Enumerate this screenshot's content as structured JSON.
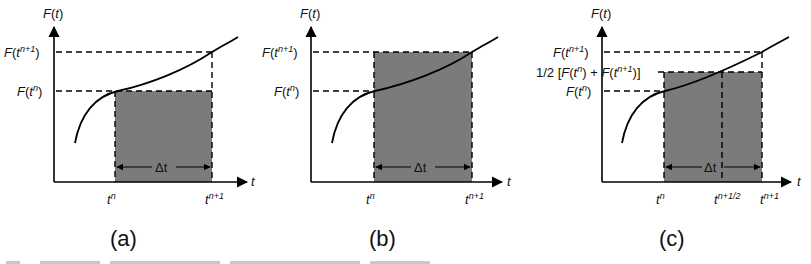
{
  "figure": {
    "panels": [
      {
        "id": "a",
        "caption": "(a)",
        "y_axis_label": "F(t)",
        "x_axis_label": "t",
        "y_levels": [
          {
            "label_base": "F(t",
            "label_sup": "n+1",
            "label_close": ")"
          },
          {
            "label_base": "F(t",
            "label_sup": "n",
            "label_close": ")"
          }
        ],
        "x_ticks": [
          {
            "base": "t",
            "sup": "n"
          },
          {
            "base": "t",
            "sup": "n+1"
          }
        ],
        "interval_label": "Δt",
        "shaded_height": "F(t^n)"
      },
      {
        "id": "b",
        "caption": "(b)",
        "y_axis_label": "F(t)",
        "x_axis_label": "t",
        "y_levels": [
          {
            "label_base": "F(t",
            "label_sup": "n+1",
            "label_close": ")"
          },
          {
            "label_base": "F(t",
            "label_sup": "n",
            "label_close": ")"
          }
        ],
        "x_ticks": [
          {
            "base": "t",
            "sup": "n"
          },
          {
            "base": "t",
            "sup": "n+1"
          }
        ],
        "interval_label": "Δt",
        "shaded_height": "F(t^(n+1))"
      },
      {
        "id": "c",
        "caption": "(c)",
        "y_axis_label": "F(t)",
        "x_axis_label": "t",
        "y_levels": [
          {
            "label_base": "F(t",
            "label_sup": "n+1",
            "label_close": ")"
          },
          {
            "label_mid_prefix": "1/2 [F(t",
            "label_mid_sup1": "n",
            "label_mid_middle": ") + F(t",
            "label_mid_sup2": "n+1",
            "label_mid_close": ")]"
          },
          {
            "label_base": "F(t",
            "label_sup": "n",
            "label_close": ")"
          }
        ],
        "x_ticks": [
          {
            "base": "t",
            "sup": "n"
          },
          {
            "base": "t",
            "sup": "n+1/2"
          },
          {
            "base": "t",
            "sup": "n+1"
          }
        ],
        "interval_label": "Δt",
        "shaded_height": "1/2 [F(t^n) + F(t^(n+1))]"
      }
    ],
    "colors": {
      "shade": "#7b7b7b",
      "line": "#000000",
      "background": "#ffffff"
    }
  }
}
